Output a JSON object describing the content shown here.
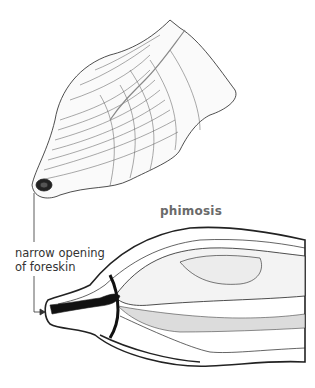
{
  "diagram": {
    "title": "phimosis",
    "annotations": [
      {
        "line1": "narrow opening",
        "line2": "of foreskin"
      }
    ],
    "subjects": [
      "external view of penis with phimosis",
      "cross-section of penis showing narrow foreskin opening"
    ]
  }
}
